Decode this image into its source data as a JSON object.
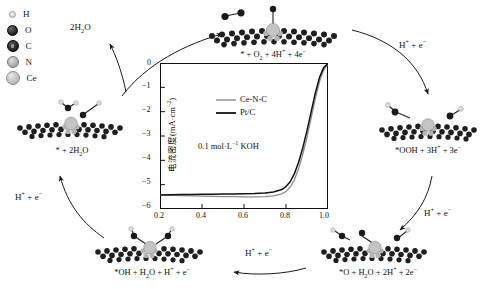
{
  "atom_legend": {
    "name": "atom-color-key",
    "items": [
      {
        "symbol": "H",
        "color": "#dcdcdc",
        "size": "smallest"
      },
      {
        "symbol": "O",
        "color": "#000000",
        "size": "small"
      },
      {
        "symbol": "C",
        "color": "#1a1a1a",
        "size": "medium"
      },
      {
        "symbol": "N",
        "color": "#b0b0b0",
        "size": "medium"
      },
      {
        "symbol": "Ce",
        "color": "#c8c8c8",
        "size": "large"
      }
    ]
  },
  "cycle": {
    "structures": [
      {
        "id": "top",
        "caption": "* + O2 + 4H+ + 4e−",
        "caption_html": "* + O<sub>2</sub> + 4H<sup>+</sup> + 4e<sup>−</sup>"
      },
      {
        "id": "right",
        "caption": "*OOH + 3H+ + 3e−",
        "caption_html": "*OOH + 3H<sup>+</sup> + 3e<sup>−</sup>"
      },
      {
        "id": "bottom-right",
        "caption": "*O + H2O + 2H+ + 2e−",
        "caption_html": "*O + H<sub>2</sub>O + 2H<sup>+</sup> + 2e<sup>−</sup>"
      },
      {
        "id": "bottom-left",
        "caption": "*OH + H2O + H+ + e−",
        "caption_html": "*OH + H<sub>2</sub>O + H<sup>+</sup> + e<sup>−</sup>"
      },
      {
        "id": "left",
        "caption": "* + 2H2O",
        "caption_html": "* + 2H<sub>2</sub>O"
      }
    ],
    "arrow_labels": [
      {
        "id": "top-left",
        "text": "2H2O",
        "text_html": "2H<sub>2</sub>O"
      },
      {
        "id": "top-right",
        "text": "H+ + e−",
        "text_html": "H<sup>+</sup> + e<sup>−</sup>"
      },
      {
        "id": "right",
        "text": "H+ + e−",
        "text_html": "H<sup>+</sup> + e<sup>−</sup>"
      },
      {
        "id": "bottom",
        "text": "H+ + e−",
        "text_html": "H<sup>+</sup> + e<sup>−</sup>"
      },
      {
        "id": "left",
        "text": "H+ + e−",
        "text_html": "H<sup>+</sup> + e<sup>−</sup>"
      }
    ]
  },
  "chart_data": {
    "type": "line",
    "title": "",
    "xlabel": "电势(V vs. RHE)",
    "ylabel": "电流密度(mA·cm⁻²)",
    "xlim": [
      0.2,
      1.0
    ],
    "ylim": [
      -6,
      0
    ],
    "xticks": [
      0.2,
      0.4,
      0.6,
      0.8,
      1.0
    ],
    "xtick_labels": [
      "0.2",
      "0.4",
      "0.6",
      "0.8",
      "1.0"
    ],
    "yticks": [
      0,
      -1,
      -2,
      -3,
      -4,
      -5,
      -6
    ],
    "ytick_labels": [
      "0",
      "−1",
      "−2",
      "−3",
      "−4",
      "−5",
      "−6"
    ],
    "grid": false,
    "legend_position": "upper-center",
    "annotation": "0.1 mol·L⁻¹ KOH",
    "annotation_parts": {
      "pre": "0.1 mol·L",
      "sup": "−1",
      "post": " KOH"
    },
    "series": [
      {
        "name": "Ce-N-C",
        "color": "#8c8c8c",
        "x": [
          0.2,
          0.25,
          0.3,
          0.35,
          0.4,
          0.45,
          0.5,
          0.55,
          0.6,
          0.65,
          0.7,
          0.74,
          0.78,
          0.8,
          0.82,
          0.84,
          0.86,
          0.88,
          0.9,
          0.92,
          0.94,
          0.96,
          0.98,
          1.0
        ],
        "y": [
          -5.42,
          -5.44,
          -5.45,
          -5.46,
          -5.47,
          -5.48,
          -5.49,
          -5.49,
          -5.5,
          -5.5,
          -5.49,
          -5.46,
          -5.38,
          -5.28,
          -5.1,
          -4.8,
          -4.35,
          -3.75,
          -3.05,
          -2.25,
          -1.45,
          -0.75,
          -0.28,
          -0.05
        ]
      },
      {
        "name": "Pt/C",
        "color": "#111111",
        "x": [
          0.2,
          0.25,
          0.3,
          0.35,
          0.4,
          0.45,
          0.5,
          0.55,
          0.6,
          0.65,
          0.7,
          0.74,
          0.78,
          0.8,
          0.82,
          0.84,
          0.86,
          0.88,
          0.9,
          0.92,
          0.94,
          0.96,
          0.98,
          1.0
        ],
        "y": [
          -5.42,
          -5.41,
          -5.4,
          -5.4,
          -5.39,
          -5.39,
          -5.38,
          -5.38,
          -5.37,
          -5.36,
          -5.34,
          -5.3,
          -5.2,
          -5.08,
          -4.88,
          -4.55,
          -4.08,
          -3.48,
          -2.78,
          -2.0,
          -1.22,
          -0.58,
          -0.18,
          -0.02
        ]
      }
    ]
  }
}
